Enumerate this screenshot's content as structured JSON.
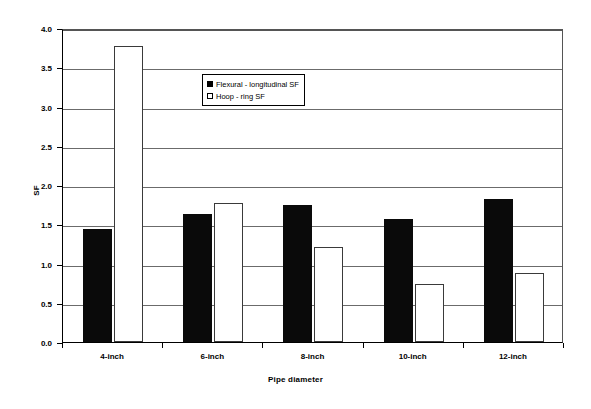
{
  "chart_data": {
    "type": "bar",
    "title": "",
    "xlabel": "Pipe diameter",
    "ylabel": "SF",
    "categories": [
      "4-inch",
      "6-inch",
      "8-inch",
      "10-inch",
      "12-inch"
    ],
    "series": [
      {
        "name": "Flexural - longitudinal SF",
        "color": "#000000",
        "values": [
          1.44,
          1.63,
          1.74,
          1.57,
          1.82
        ]
      },
      {
        "name": "Hoop - ring SF",
        "color": "#ffffff",
        "values": [
          3.77,
          1.77,
          1.21,
          0.74,
          0.88
        ]
      }
    ],
    "ylim": [
      0.0,
      4.0
    ],
    "ytick_labels": [
      "0.0",
      "0.5",
      "1.0",
      "1.5",
      "2.0",
      "2.5",
      "3.0",
      "3.5",
      "4.0"
    ],
    "ytick_values": [
      0.0,
      0.5,
      1.0,
      1.5,
      2.0,
      2.5,
      3.0,
      3.5,
      4.0
    ],
    "grid": true,
    "legend_position": "upper-center"
  },
  "legend": {
    "items": [
      {
        "label": "Flexural - longitudinal SF",
        "marker": "filled-square"
      },
      {
        "label": "Hoop - ring SF",
        "marker": "open-square"
      }
    ]
  },
  "axes": {
    "y_title": "SF",
    "x_title": "Pipe diameter"
  }
}
